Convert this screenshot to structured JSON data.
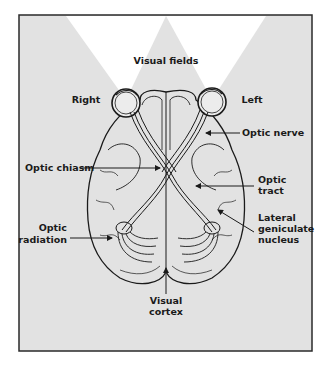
{
  "diagram": {
    "colors": {
      "frame_fill": "#e2e2e2",
      "frame_border": "#2a2a2a",
      "visual_field": "#ffffff",
      "ink": "#1a1a1a"
    },
    "labels": {
      "visual_fields": "Visual fields",
      "right": "Right",
      "left": "Left",
      "optic_nerve": "Optic nerve",
      "optic_chiasm": "Optic chiasm",
      "optic_tract": [
        "Optic",
        "tract"
      ],
      "optic_radiation": [
        "Optic",
        "radiation"
      ],
      "lateral_geniculate_nucleus": [
        "Lateral",
        "geniculate",
        "nucleus"
      ],
      "visual_cortex": [
        "Visual",
        "cortex"
      ]
    }
  }
}
